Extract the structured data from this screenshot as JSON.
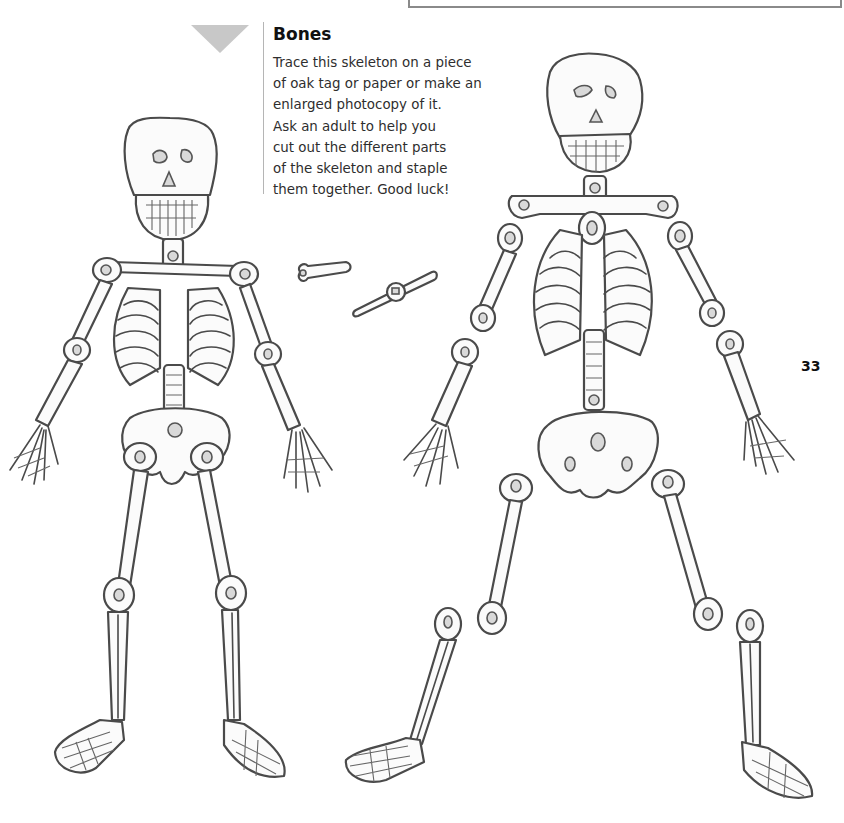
{
  "section": {
    "title": "Bones",
    "instructions": [
      "Trace this skeleton on a piece",
      "of oak tag or paper or make an",
      "enlarged photocopy of it.",
      "Ask an adult to help you",
      "cut out the different parts",
      "of the skeleton and staple",
      "them together. Good luck!"
    ]
  },
  "page_number": "33",
  "illustrations": {
    "assembled_skeleton": "assembled-skeleton",
    "cutout_skeleton": "cutout-parts-skeleton",
    "fasteners": [
      "paper-fastener-side",
      "paper-fastener-open"
    ]
  },
  "colors": {
    "marker_triangle": "#c8c8c8",
    "divider": "#b5b5b5",
    "text": "#2e2e2e",
    "outline": "#4a4a4a"
  }
}
